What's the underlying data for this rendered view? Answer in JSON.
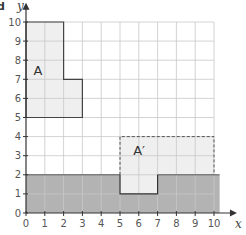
{
  "part_label": "d",
  "axes": {
    "x_label": "x",
    "y_label": "y",
    "x_ticks": [
      "0",
      "1",
      "2",
      "3",
      "4",
      "5",
      "6",
      "7",
      "8",
      "9",
      "10"
    ],
    "y_ticks": [
      "0",
      "1",
      "2",
      "3",
      "4",
      "5",
      "6",
      "7",
      "8",
      "9",
      "10"
    ],
    "x_range": [
      0,
      10
    ],
    "y_range": [
      0,
      10
    ],
    "grid": true
  },
  "shapes": {
    "A": {
      "label": "A",
      "vertices": [
        [
          0,
          5
        ],
        [
          0,
          10
        ],
        [
          2,
          10
        ],
        [
          2,
          7
        ],
        [
          3,
          7
        ],
        [
          3,
          5
        ]
      ],
      "fill": "#efefef",
      "stroke": "#444444",
      "style": "solid"
    },
    "A_prime": {
      "label": "A′",
      "vertices": [
        [
          5,
          1
        ],
        [
          5,
          4
        ],
        [
          10,
          4
        ],
        [
          10,
          2
        ],
        [
          7,
          2
        ],
        [
          7,
          1
        ]
      ],
      "fill": "#efefef",
      "stroke": "#555555",
      "style": "dashed"
    },
    "shaded_region": {
      "label": "",
      "x_range": [
        0,
        10.3
      ],
      "y_range": [
        0,
        2
      ],
      "fill": "#b3b3b3"
    }
  },
  "colors": {
    "grid": "#c8c8c8",
    "axis": "#333333",
    "light_fill": "#efefef",
    "dark_fill": "#b3b3b3"
  }
}
